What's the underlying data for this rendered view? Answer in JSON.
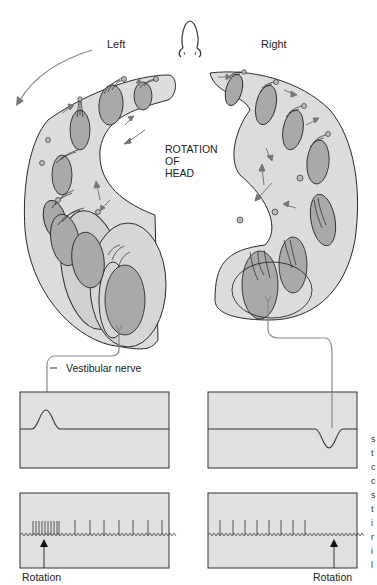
{
  "labels": {
    "left": "Left",
    "right": "Right",
    "rotation_of_head": [
      "ROTATION",
      "OF",
      "HEAD"
    ],
    "vestibular_nerve": "Vestibular nerve",
    "rotation_left": "Rotation",
    "rotation_right": "Rotation"
  },
  "icons": {
    "nose": "nose-icon",
    "arrow": "arrow-icon"
  },
  "colors": {
    "canal_fill": "#dcdcdc",
    "hair_cell_fill": "#a9a9a9",
    "outline": "#2a2a2a",
    "trace_box_fill": "#e0e0e0",
    "nerve_line": "#8a8a8a",
    "arrow": "#7a7a7a"
  },
  "traces": {
    "left_potential": "depolarization",
    "right_potential": "hyperpolarization",
    "left_spikes": {
      "burst_count": 10,
      "tonic_count": 7
    },
    "right_spikes": {
      "tonic_count": 8
    }
  },
  "edge_text": "s t c c s t i r i l"
}
